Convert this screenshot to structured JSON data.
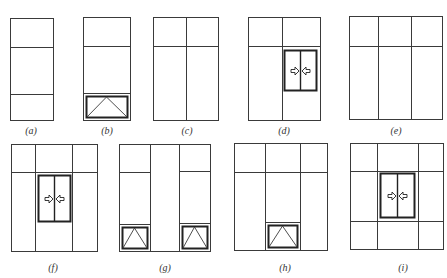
{
  "colors": {
    "line": "#3a3a3a",
    "thick": "#222222",
    "background": "#ffffff"
  },
  "panels": [
    {
      "id": "a",
      "label": "(a)",
      "label_pos": [
        31,
        125
      ],
      "frame": [
        10,
        18,
        53,
        120
      ],
      "lines": [
        [
          10,
          47,
          53,
          47
        ],
        [
          10,
          94,
          53,
          94
        ]
      ],
      "doors": [],
      "drawers": []
    },
    {
      "id": "b",
      "label": "(b)",
      "label_pos": [
        107,
        125
      ],
      "frame": [
        83,
        17,
        130,
        120
      ],
      "lines": [
        [
          83,
          46,
          130,
          46
        ]
      ],
      "doors": [],
      "drawers": [
        {
          "outer": [
            83,
            93,
            130,
            120
          ],
          "inner": [
            86,
            96,
            127,
            117
          ]
        }
      ]
    },
    {
      "id": "c",
      "label": "(c)",
      "label_pos": [
        187,
        125
      ],
      "frame": [
        153,
        17,
        218,
        120
      ],
      "lines": [
        [
          186,
          17,
          186,
          120
        ],
        [
          153,
          46,
          218,
          46
        ]
      ],
      "doors": [],
      "drawers": []
    },
    {
      "id": "d",
      "label": "(d)",
      "label_pos": [
        284,
        125
      ],
      "frame": [
        248,
        17,
        320,
        120
      ],
      "lines": [
        [
          282,
          17,
          282,
          120
        ],
        [
          248,
          46,
          320,
          46
        ]
      ],
      "doors": [
        {
          "rect": [
            284,
            50,
            316,
            90
          ]
        }
      ],
      "drawers": []
    },
    {
      "id": "e",
      "label": "(e)",
      "label_pos": [
        396,
        125
      ],
      "frame": [
        349,
        16,
        442,
        119
      ],
      "lines": [
        [
          378,
          16,
          378,
          119
        ],
        [
          411,
          16,
          411,
          119
        ],
        [
          349,
          46,
          442,
          46
        ]
      ],
      "doors": [],
      "drawers": []
    },
    {
      "id": "f",
      "label": "(f)",
      "label_pos": [
        53,
        262
      ],
      "frame": [
        11,
        144,
        97,
        251
      ],
      "lines": [
        [
          35,
          144,
          35,
          251
        ],
        [
          72,
          144,
          72,
          251
        ],
        [
          11,
          172,
          97,
          172
        ]
      ],
      "doors": [
        {
          "rect": [
            38,
            175,
            70,
            221
          ]
        }
      ],
      "drawers": []
    },
    {
      "id": "g",
      "label": "(g)",
      "label_pos": [
        165,
        262
      ],
      "frame": [
        119,
        144,
        210,
        251
      ],
      "lines": [
        [
          150,
          144,
          150,
          251
        ],
        [
          179,
          144,
          179,
          251
        ],
        [
          119,
          172,
          150,
          172
        ],
        [
          179,
          171,
          210,
          171
        ]
      ],
      "doors": [],
      "drawers": [
        {
          "outer": [
            119,
            224,
            150,
            251
          ],
          "inner": [
            122,
            227,
            147,
            248
          ]
        },
        {
          "outer": [
            179,
            223,
            210,
            251
          ],
          "inner": [
            182,
            226,
            207,
            248
          ]
        }
      ]
    },
    {
      "id": "h",
      "label": "(h)",
      "label_pos": [
        285,
        262
      ],
      "frame": [
        234,
        143,
        327,
        250
      ],
      "lines": [
        [
          265,
          143,
          265,
          250
        ],
        [
          300,
          143,
          300,
          250
        ],
        [
          234,
          172,
          265,
          172
        ],
        [
          300,
          172,
          327,
          172
        ],
        [
          265,
          172,
          300,
          172
        ]
      ],
      "doors": [],
      "drawers": [
        {
          "outer": [
            265,
            222,
            300,
            250
          ],
          "inner": [
            268,
            225,
            297,
            247
          ]
        }
      ]
    },
    {
      "id": "i",
      "label": "(i)",
      "label_pos": [
        403,
        262
      ],
      "frame": [
        350,
        143,
        443,
        249
      ],
      "lines": [
        [
          377,
          143,
          377,
          249
        ],
        [
          418,
          143,
          418,
          249
        ],
        [
          350,
          171,
          443,
          171
        ],
        [
          350,
          221,
          443,
          221
        ]
      ],
      "doors": [
        {
          "rect": [
            380,
            173,
            414,
            217
          ]
        }
      ],
      "drawers": []
    }
  ]
}
